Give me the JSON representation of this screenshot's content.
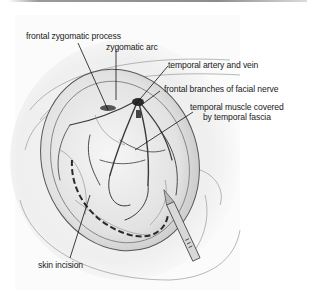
{
  "figure": {
    "type": "anatomical surgical illustration",
    "labels": [
      {
        "id": "frontal-zygomatic-process",
        "text": "frontal zygomatic process"
      },
      {
        "id": "zygomatic-arc",
        "text": "zygomatic arc"
      },
      {
        "id": "temporal-artery-and-vein",
        "text": "temporal artery and vein"
      },
      {
        "id": "frontal-branches-of-facial-nerve",
        "text": "frontal branches of facial nerve"
      },
      {
        "id": "temporal-muscle",
        "line1": "temporal muscle covered",
        "line2": "by temporal fascia"
      },
      {
        "id": "skin-incision",
        "text": "skin incision"
      }
    ]
  }
}
